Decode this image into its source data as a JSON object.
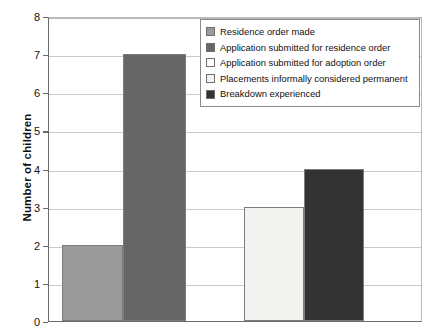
{
  "chart_data": {
    "type": "bar",
    "title": "",
    "xlabel": "",
    "ylabel": "Number of children",
    "ylim": [
      0,
      8
    ],
    "ytick_labels": [
      "0",
      "1",
      "2",
      "3",
      "4",
      "5",
      "6",
      "7",
      "8"
    ],
    "grid": true,
    "legend_position": "top-right",
    "categories": [
      "Residence order made",
      "Application submitted for residence order",
      "Application submitted for adoption order",
      "Placements informally considered permanent",
      "Breakdown experienced"
    ],
    "values": [
      2,
      7,
      0,
      3,
      4
    ],
    "colors": [
      "#9a9a9a",
      "#666666",
      "#ffffff",
      "#f2f2f0",
      "#333333"
    ],
    "series": [
      {
        "name": "Number of children",
        "values": [
          2,
          7,
          0,
          3,
          4
        ]
      }
    ]
  },
  "legend": {
    "items": [
      {
        "label": "Residence order made",
        "color": "#9a9a9a"
      },
      {
        "label": "Application submitted for residence order",
        "color": "#666666"
      },
      {
        "label": "Application submitted for adoption order",
        "color": "#ffffff"
      },
      {
        "label": "Placements informally considered permanent",
        "color": "#f2f2f0"
      },
      {
        "label": "Breakdown experienced",
        "color": "#333333"
      }
    ]
  },
  "axes": {
    "y_title": "Number of children"
  }
}
